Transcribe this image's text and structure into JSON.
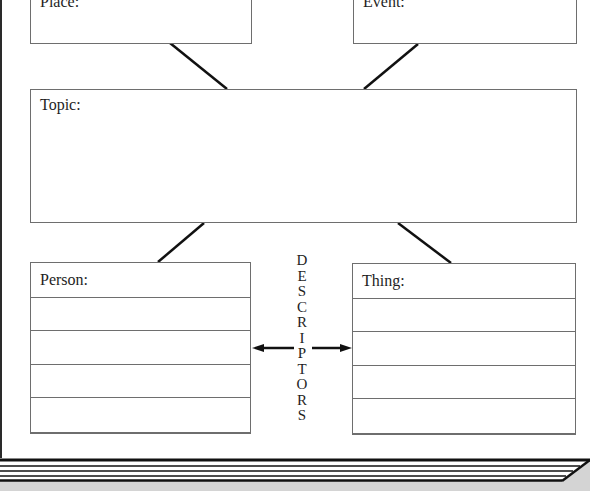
{
  "diagram": {
    "type": "graphic-organizer",
    "boxes": {
      "place": {
        "label": "Place:"
      },
      "event": {
        "label": "Event:"
      },
      "topic": {
        "label": "Topic:"
      },
      "person": {
        "label": "Person:",
        "rows": 5
      },
      "thing": {
        "label": "Thing:",
        "rows": 5
      }
    },
    "descriptors": {
      "word": "DESCRIPTORS",
      "letters": [
        "D",
        "E",
        "S",
        "C",
        "R",
        "I",
        "P",
        "T",
        "O",
        "R",
        "S"
      ]
    },
    "colors": {
      "line": "#111111",
      "border": "#6e6e6e",
      "text": "#1e1e1e",
      "footer_shade": "#d4d4d4"
    }
  }
}
